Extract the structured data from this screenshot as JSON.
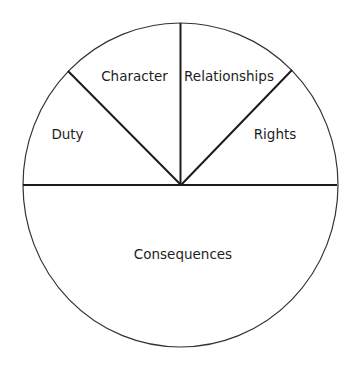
{
  "diagram": {
    "type": "divided-circle",
    "colors": {
      "background": "#ffffff",
      "outline": "#333333",
      "divider": "#1c1c1c",
      "text": "#1e1e1e"
    },
    "segments": [
      {
        "id": "duty",
        "label": "Duty"
      },
      {
        "id": "character",
        "label": "Character"
      },
      {
        "id": "relationships",
        "label": "Relationships"
      },
      {
        "id": "rights",
        "label": "Rights"
      },
      {
        "id": "consequences",
        "label": "Consequences"
      }
    ]
  }
}
